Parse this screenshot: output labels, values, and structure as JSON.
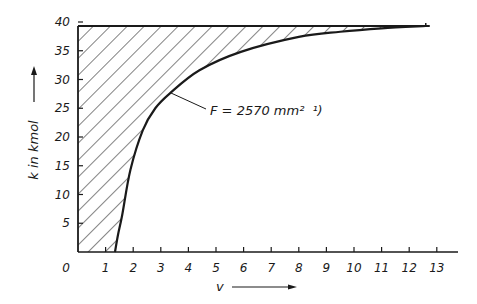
{
  "chart_data": {
    "type": "area",
    "title": "",
    "xlabel": "v",
    "ylabel": "k in kmol",
    "xlim": [
      0,
      13.8
    ],
    "ylim": [
      0,
      40
    ],
    "x_ticks": [
      1,
      2,
      3,
      4,
      5,
      6,
      7,
      8,
      9,
      10,
      11,
      12,
      13
    ],
    "x_tick_labels": [
      "0",
      "1",
      "2",
      "3",
      "4",
      "5",
      "6",
      "7",
      "8",
      "9",
      "10",
      "11",
      "12",
      "13"
    ],
    "y_ticks": [
      5,
      10,
      15,
      20,
      25,
      30,
      35,
      40
    ],
    "y_tick_labels": [
      "5",
      "10",
      "15",
      "20",
      "25",
      "30",
      "35",
      "40"
    ],
    "grid": false,
    "legend": null,
    "series": [
      {
        "name": "k(v) boundary curve",
        "x": [
          1.34,
          1.45,
          1.6,
          1.9,
          2.35,
          2.8,
          3.33,
          4.4,
          5.9,
          8.0,
          9.5,
          11.0,
          12.6
        ],
        "y": [
          0,
          3,
          6.4,
          14.3,
          21.2,
          25.0,
          27.6,
          31.6,
          34.8,
          37.4,
          38.3,
          38.9,
          39.3
        ]
      }
    ],
    "upper_bound": {
      "y": 39.3,
      "x_range": [
        0,
        12.6
      ]
    },
    "shaded_region": "hatched area between the y-axis, the line k≈39.3 and the curve",
    "annotations": [
      {
        "text": "F = 2570 mm² ¹)",
        "points_to": [
          3.3,
          27.6
        ]
      }
    ]
  },
  "labels": {
    "y_axis_title": "k in kmol",
    "x_axis_title": "v",
    "annotation": "F = 2570 mm²",
    "annotation_footnote": "¹)",
    "origin": "0"
  },
  "colors": {
    "ink": "#1a1a1a",
    "background": "#ffffff"
  }
}
